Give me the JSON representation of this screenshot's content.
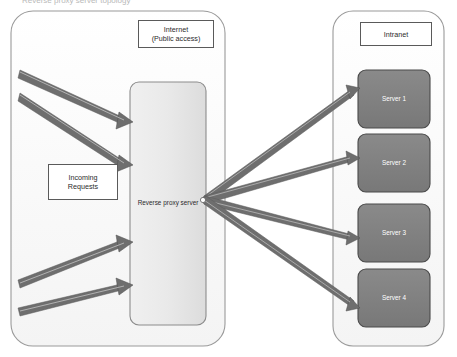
{
  "diagram": {
    "title": "Reverse proxy server topology",
    "zones": [
      {
        "id": "internet",
        "title": "Internet\n(Public access)",
        "title_line1": "Internet",
        "title_line2": "(Public access)"
      },
      {
        "id": "intranet",
        "title": "Intranet"
      }
    ],
    "nodes": {
      "incoming_requests": "Incoming\nRequests",
      "reverse_proxy": "Reverse proxy server",
      "servers": [
        {
          "label": "Server 1"
        },
        {
          "label": "Server 2"
        },
        {
          "label": "Server 3"
        },
        {
          "label": "Server 4"
        }
      ]
    },
    "colors": {
      "zone_fill": "#fbfbfb",
      "zone_stroke": "#9a9a9a",
      "proxy_fill": "#e8e8e8",
      "proxy_stroke": "#8c8c8c",
      "server_fill": "#808080",
      "server_stroke": "#4a4a4a",
      "server_text": "#ffffff",
      "arrow_fill": "#6e6e6e",
      "arrow_highlight": "#b5b5b5",
      "label_text": "#2b2b2b",
      "label_box_stroke": "#5a5a5a",
      "background": "#ffffff"
    },
    "inbound_arrow_count": 4,
    "outbound_arrow_count": 4
  }
}
